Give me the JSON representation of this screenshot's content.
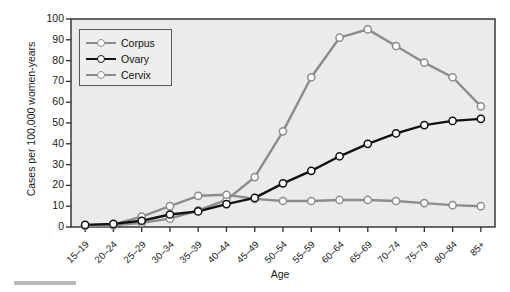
{
  "chart_data": {
    "type": "line",
    "title": "",
    "xlabel": "Age",
    "ylabel": "Cases per 100,000 women-years",
    "categories": [
      "15–19",
      "20–24",
      "25–29",
      "30–34",
      "35–39",
      "40–44",
      "45–49",
      "50–54",
      "55–59",
      "60–64",
      "65–69",
      "70–74",
      "75–79",
      "80–84",
      "85+"
    ],
    "ylim": [
      0,
      100
    ],
    "yticks": [
      0,
      10,
      20,
      30,
      40,
      50,
      60,
      70,
      80,
      90,
      100
    ],
    "grid": false,
    "legend_position": "upper-left",
    "series": [
      {
        "name": "Corpus",
        "color": "#8c8c8c",
        "marker": "circle-open",
        "values": [
          0.5,
          0.8,
          2.0,
          4.0,
          8.0,
          13.0,
          24.0,
          46.0,
          72.0,
          91.0,
          95.0,
          87.0,
          79.0,
          72.0,
          58.0
        ]
      },
      {
        "name": "Ovary",
        "color": "#111111",
        "marker": "circle-open",
        "values": [
          1.0,
          1.5,
          3.0,
          6.0,
          7.5,
          11.0,
          14.0,
          21.0,
          27.0,
          34.0,
          40.0,
          45.0,
          49.0,
          51.0,
          52.0
        ]
      },
      {
        "name": "Cervix",
        "color": "#8c8c8c",
        "marker": "circle-open",
        "values": [
          0.8,
          1.2,
          5.0,
          10.0,
          15.0,
          15.5,
          13.5,
          12.5,
          12.5,
          13.0,
          13.0,
          12.5,
          11.5,
          10.5,
          10.0
        ]
      }
    ]
  },
  "legend": {
    "entries": [
      "Corpus",
      "Ovary",
      "Cervix"
    ]
  },
  "axes": {
    "y_title": "Cases per 100,000 women-years",
    "x_title": "Age",
    "y_tick_labels": [
      "100",
      "90",
      "80",
      "70",
      "60",
      "50",
      "40",
      "30",
      "20",
      "10",
      "0"
    ]
  },
  "colors": {
    "plot_background": "#ebebeb",
    "axis": "#2b2b2b",
    "gray_series": "#8c8c8c",
    "black_series": "#111111",
    "marker_fill": "#ffffff"
  },
  "footer": {
    "rule": ""
  }
}
